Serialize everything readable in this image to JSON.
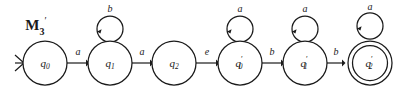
{
  "figure": {
    "title": "M",
    "title_sub": "3",
    "title_prime": "′",
    "background_color": "#ffffff",
    "stroke_color": "#1a1a1a"
  },
  "automaton": {
    "start_state": "q0",
    "start_marker": "〉",
    "states": [
      {
        "id": "q0",
        "base": "q",
        "sub": "0",
        "prime": "",
        "cx": 45,
        "cy": 63,
        "r": 22,
        "accepting": false
      },
      {
        "id": "q1",
        "base": "q",
        "sub": "1",
        "prime": "",
        "cx": 110,
        "cy": 63,
        "r": 22,
        "accepting": false
      },
      {
        "id": "q2",
        "base": "q",
        "sub": "2",
        "prime": "",
        "cx": 174,
        "cy": 63,
        "r": 22,
        "accepting": false
      },
      {
        "id": "q0p",
        "base": "q",
        "sub": "0",
        "prime": "′",
        "cx": 240,
        "cy": 63,
        "r": 22,
        "accepting": false
      },
      {
        "id": "q1p",
        "base": "q",
        "sub": "1",
        "prime": "′",
        "cx": 305,
        "cy": 63,
        "r": 22,
        "accepting": false
      },
      {
        "id": "q2p",
        "base": "q",
        "sub": "2",
        "prime": "′",
        "cx": 370,
        "cy": 63,
        "r": 22,
        "accepting": true
      }
    ],
    "transitions": [
      {
        "from": "q0",
        "to": "q1",
        "label": "a",
        "x1": 67,
        "x2": 88,
        "y": 63,
        "label_x": 78,
        "label_y": 55
      },
      {
        "from": "q1",
        "to": "q2",
        "label": "a",
        "x1": 132,
        "x2": 152,
        "y": 63,
        "label_x": 142,
        "label_y": 55
      },
      {
        "from": "q2",
        "to": "q0p",
        "label": "e",
        "x1": 196,
        "x2": 218,
        "y": 63,
        "label_x": 207,
        "label_y": 55
      },
      {
        "from": "q0p",
        "to": "q1p",
        "label": "b",
        "x1": 262,
        "x2": 283,
        "y": 63,
        "label_x": 272,
        "label_y": 55
      },
      {
        "from": "q1p",
        "to": "q2p",
        "label": "b",
        "x1": 327,
        "x2": 344,
        "y": 63,
        "label_x": 336,
        "label_y": 55
      }
    ],
    "self_loops": [
      {
        "state": "q1",
        "label": "b",
        "cx": 110,
        "cy": 29,
        "r": 13,
        "label_x": 110,
        "label_y": 12
      },
      {
        "state": "q0p",
        "label": "a",
        "cx": 240,
        "cy": 29,
        "r": 13,
        "label_x": 240,
        "label_y": 12
      },
      {
        "state": "q1p",
        "label": "a",
        "cx": 305,
        "cy": 29,
        "r": 13,
        "label_x": 305,
        "label_y": 12
      },
      {
        "state": "q2p",
        "label": "a",
        "cx": 370,
        "cy": 26,
        "r": 13,
        "label_x": 370,
        "label_y": 10
      }
    ],
    "alphabet": [
      "a",
      "b",
      "e"
    ]
  }
}
